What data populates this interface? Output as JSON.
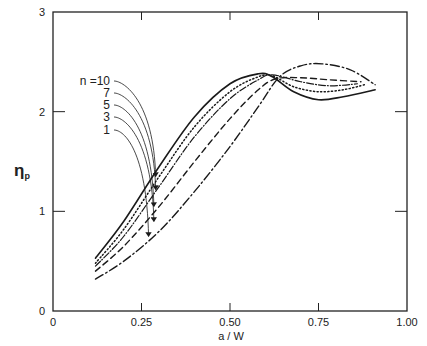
{
  "chart_data": {
    "type": "line",
    "title": "",
    "xlabel": "a / W",
    "ylabel_main": "η",
    "ylabel_sub": "p",
    "xlim": [
      0,
      1.0
    ],
    "ylim": [
      0,
      3
    ],
    "xticks": [
      0,
      0.25,
      0.5,
      0.75,
      1.0
    ],
    "xtick_labels": [
      "0",
      "0.25",
      "0.50",
      "0.75",
      "1.00"
    ],
    "yticks": [
      0,
      1,
      2,
      3
    ],
    "ytick_labels": [
      "0",
      "1",
      "2",
      "3"
    ],
    "grid": false,
    "legend_title": "n =",
    "legend_placement": "left, with leader arrows to curves",
    "series": [
      {
        "name": "n = 10",
        "label": "10",
        "style": "solid",
        "x": [
          0.12,
          0.2,
          0.3,
          0.4,
          0.5,
          0.58,
          0.62,
          0.68,
          0.75,
          0.82,
          0.91
        ],
        "y": [
          0.53,
          0.9,
          1.45,
          1.95,
          2.28,
          2.38,
          2.35,
          2.2,
          2.12,
          2.15,
          2.22
        ]
      },
      {
        "name": "n = 7",
        "label": "7",
        "style": "dotted",
        "x": [
          0.12,
          0.2,
          0.3,
          0.4,
          0.5,
          0.58,
          0.62,
          0.68,
          0.75,
          0.82,
          0.88
        ],
        "y": [
          0.48,
          0.82,
          1.35,
          1.85,
          2.2,
          2.35,
          2.36,
          2.25,
          2.2,
          2.22,
          2.27
        ]
      },
      {
        "name": "n = 5",
        "label": "5",
        "style": "solid-thin",
        "x": [
          0.12,
          0.2,
          0.3,
          0.4,
          0.5,
          0.58,
          0.62,
          0.7,
          0.78,
          0.86
        ],
        "y": [
          0.45,
          0.75,
          1.25,
          1.75,
          2.13,
          2.32,
          2.37,
          2.3,
          2.26,
          2.28
        ]
      },
      {
        "name": "n = 3",
        "label": "3",
        "style": "dashed",
        "x": [
          0.12,
          0.2,
          0.3,
          0.4,
          0.5,
          0.58,
          0.63,
          0.7,
          0.78,
          0.87
        ],
        "y": [
          0.4,
          0.65,
          1.05,
          1.5,
          1.93,
          2.22,
          2.33,
          2.34,
          2.32,
          2.3
        ]
      },
      {
        "name": "n = 1",
        "label": "1",
        "style": "dash-dot",
        "x": [
          0.12,
          0.2,
          0.3,
          0.4,
          0.5,
          0.58,
          0.64,
          0.7,
          0.76,
          0.84,
          0.91
        ],
        "y": [
          0.32,
          0.5,
          0.8,
          1.2,
          1.65,
          2.05,
          2.35,
          2.46,
          2.48,
          2.42,
          2.27
        ]
      }
    ]
  }
}
